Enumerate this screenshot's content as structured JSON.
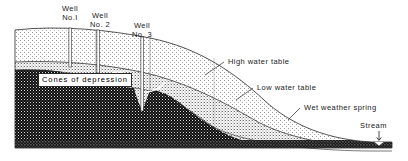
{
  "figure": {
    "type": "hydrogeologic-cross-section",
    "width": 408,
    "height": 161,
    "background": "#ffffff"
  },
  "colors": {
    "ink": "#1a1a1a",
    "outline": "#2a2a2a",
    "unsaturated_zone": "#f2f2f2",
    "capillary_band": "#d2d2d2",
    "saturated_zone": "#121212",
    "bedrock_band": "#1b1b1b",
    "label_box_fill": "#ffffff",
    "leader_line": "#2a2a2a"
  },
  "labels": {
    "well_1": {
      "line1": "Well",
      "line2": "No.I"
    },
    "well_2": {
      "line1": "Well",
      "line2": "No. 2"
    },
    "well_3": {
      "line1": "Well",
      "line2": "No. 3"
    },
    "cones_of_depression": "Cones of depression",
    "high_water_table": "High water table",
    "low_water_table": "Low water table",
    "wet_weather_spring": "Wet weather spring",
    "stream": "Stream"
  },
  "features": {
    "wells": [
      {
        "id": "well-1",
        "name": "Well No.I",
        "x": 70,
        "top_y": 28,
        "bottom_y": 67,
        "shaft_width": 2.2,
        "has_cone_of_depression": true
      },
      {
        "id": "well-2",
        "name": "Well No. 2",
        "x": 98,
        "top_y": 30,
        "bottom_y": 72,
        "shaft_width": 2.2,
        "has_cone_of_depression": true
      },
      {
        "id": "well-3",
        "name": "Well No. 3",
        "x": 142,
        "top_y": 33,
        "bottom_y": 110,
        "shaft_width": 2.2,
        "has_cone_of_depression": true
      }
    ],
    "zones": [
      {
        "id": "unsaturated-zone",
        "label": "unsaturated stippled zone",
        "tone": "light"
      },
      {
        "id": "capillary-band",
        "label": "band between high and low water table",
        "tone": "medium"
      },
      {
        "id": "saturated-zone",
        "label": "saturated dark stippled zone",
        "tone": "dark"
      },
      {
        "id": "bedrock-band",
        "label": "basal band",
        "tone": "dark"
      }
    ],
    "water_tables": [
      {
        "id": "high-water-table",
        "label": "High water table",
        "style": "solid-thin"
      },
      {
        "id": "low-water-table",
        "label": "Low water table",
        "style": "solid-thin"
      }
    ],
    "spring": {
      "id": "wet-weather-spring",
      "label": "Wet weather spring",
      "x": 296,
      "y": 118
    },
    "stream": {
      "id": "stream",
      "label": "Stream",
      "x": 381,
      "y": 140,
      "arrow": "down"
    }
  },
  "leaders": {
    "high_water_table": {
      "from_x": 224,
      "from_y": 62,
      "to_x": 205,
      "to_y": 75
    },
    "low_water_table": {
      "from_x": 253,
      "from_y": 88,
      "to_x": 236,
      "to_y": 100
    },
    "wet_weather_spring": {
      "from_x": 300,
      "from_y": 108,
      "to_x": 288,
      "to_y": 120
    },
    "cones_of_depression": {
      "from_x": 168,
      "from_y": 82,
      "to_x": 150,
      "to_y": 90
    }
  }
}
